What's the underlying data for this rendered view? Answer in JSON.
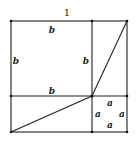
{
  "diagram": {
    "title_label": "1",
    "labels": {
      "top_b": "b",
      "left_b": "b",
      "mid_b": "b",
      "inner_b": "b",
      "a_top": "a",
      "a_left": "a",
      "a_right": "a",
      "a_bottom": "a"
    },
    "colors": {
      "stroke": "#222222",
      "background": "#ffffff"
    }
  }
}
